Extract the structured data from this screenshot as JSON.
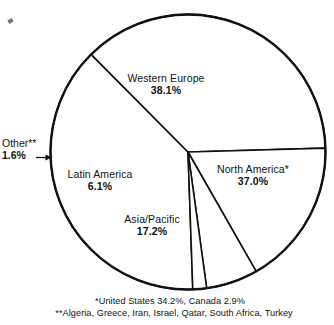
{
  "chart_data": {
    "type": "pie",
    "title": "",
    "subtitle": "",
    "xlabel": "",
    "ylabel": "",
    "legend_position": "none",
    "grid": false,
    "labels_on_slices": true,
    "categories": [
      "Western Europe",
      "North America*",
      "Asia/Pacific",
      "Latin America",
      "Other**"
    ],
    "values": [
      38.1,
      37.0,
      17.2,
      6.1,
      1.6
    ],
    "unit": "%",
    "slices": [
      {
        "name": "Western Europe",
        "display_name": "Western Europe",
        "value": 38.1,
        "value_label": "38.1%",
        "start_angle_deg": 178.0,
        "end_angle_deg": 315.2,
        "label_placement": "inside"
      },
      {
        "name": "North America",
        "display_name": "North America*",
        "value": 37.0,
        "value_label": "37.0%",
        "start_angle_deg": 315.2,
        "end_angle_deg": 88.4,
        "label_placement": "inside"
      },
      {
        "name": "Asia/Pacific",
        "display_name": "Asia/Pacific",
        "value": 17.2,
        "value_label": "17.2%",
        "start_angle_deg": 88.4,
        "end_angle_deg": 150.3,
        "label_placement": "inside"
      },
      {
        "name": "Latin America",
        "display_name": "Latin America",
        "value": 6.1,
        "value_label": "6.1%",
        "start_angle_deg": 150.3,
        "end_angle_deg": 172.2,
        "label_placement": "inside"
      },
      {
        "name": "Other",
        "display_name": "Other**",
        "value": 1.6,
        "value_label": "1.6%",
        "start_angle_deg": 172.2,
        "end_angle_deg": 178.0,
        "label_placement": "outside-left-with-arrow"
      }
    ],
    "colors": {
      "slice_fill": "#ffffff",
      "outline": "#111111",
      "text": "#111111",
      "background": "#ffffff"
    },
    "footnotes": [
      "*United States 34.2%, Canada 2.9%",
      "**Algeria, Greece, Iran, Israel, Qatar, South Africa, Turkey"
    ]
  },
  "labels": {
    "western_europe": {
      "name": "Western Europe",
      "value": "38.1%"
    },
    "north_america": {
      "name": "North America*",
      "value": "37.0%"
    },
    "asia_pacific": {
      "name": "Asia/Pacific",
      "value": "17.2%"
    },
    "latin_america": {
      "name": "Latin America",
      "value": "6.1%"
    },
    "other": {
      "name": "Other**",
      "value": "1.6%",
      "arrow": "→"
    }
  },
  "footnotes": {
    "line1": "*United States 34.2%, Canada 2.9%",
    "line2": "**Algeria, Greece, Iran, Israel, Qatar, South Africa, Turkey"
  }
}
